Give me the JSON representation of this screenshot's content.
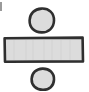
{
  "icon": {
    "name": "division-sign",
    "symbol": "÷",
    "style": "hand-drawn",
    "colors": {
      "fill": "#dcdcdc",
      "stroke": "#2f2f2f",
      "edge_mark": "#9a9a9a",
      "background": "#ffffff"
    }
  }
}
